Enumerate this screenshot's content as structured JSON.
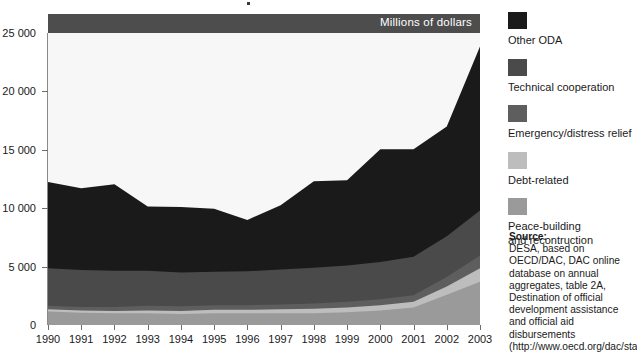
{
  "banner": {
    "label": "Millions of dollars"
  },
  "legend": {
    "items": [
      {
        "label": "Other ODA",
        "color": "#1a1a1a",
        "key": "other_oda"
      },
      {
        "label": "Technical cooperation",
        "color": "#4a4a4a",
        "key": "technical_cooperation"
      },
      {
        "label": "Emergency/distress relief",
        "color": "#5e5e5e",
        "key": "emergency_distress_relief"
      },
      {
        "label": "Debt-related",
        "color": "#bdbdbd",
        "key": "debt_related"
      },
      {
        "label": "Peace-building\nand recontruction",
        "color": "#9a9a9a",
        "key": "peace_building"
      }
    ]
  },
  "source": {
    "title": "Source:",
    "text": "DESA, based on OECD/DAC, DAC online database on annual aggregates, table 2A, Destination of official development assistance and official aid disbursements (http://www.oecd.org/dac/stats/idsonline)."
  },
  "chart_data": {
    "type": "area",
    "title": "Millions of dollars",
    "xlabel": "",
    "ylabel": "Millions of dollars",
    "ylim": [
      0,
      25000
    ],
    "ytick_values": [
      0,
      5000,
      10000,
      15000,
      20000,
      25000
    ],
    "ytick_labels": [
      "0",
      "5 000",
      "10 000",
      "15 000",
      "20 000",
      "25 000"
    ],
    "grid": false,
    "legend_position": "right",
    "stacked": true,
    "stack_order_bottom_to_top": [
      "Peace-building and recontruction",
      "Debt-related",
      "Emergency/distress relief",
      "Technical cooperation",
      "Other ODA"
    ],
    "categories": [
      1990,
      1991,
      1992,
      1993,
      1994,
      1995,
      1996,
      1997,
      1998,
      1999,
      2000,
      2001,
      2002,
      2003
    ],
    "x": [
      "1990",
      "1991",
      "1992",
      "1993",
      "1994",
      "1995",
      "1996",
      "1997",
      "1998",
      "1999",
      "2000",
      "2001",
      "2002",
      "2003"
    ],
    "series": [
      {
        "name": "Peace-building and recontruction",
        "color": "#9a9a9a",
        "values": [
          1150,
          1050,
          1000,
          1000,
          950,
          1000,
          1000,
          1000,
          1000,
          1100,
          1250,
          1500,
          2600,
          3700
        ]
      },
      {
        "name": "Debt-related",
        "color": "#bdbdbd",
        "values": [
          200,
          200,
          200,
          250,
          250,
          300,
          300,
          350,
          400,
          400,
          450,
          500,
          700,
          1150
        ]
      },
      {
        "name": "Emergency/distress relief",
        "color": "#5e5e5e",
        "values": [
          300,
          300,
          350,
          400,
          400,
          400,
          400,
          400,
          450,
          500,
          500,
          550,
          800,
          1100
        ]
      },
      {
        "name": "Technical cooperation",
        "color": "#4a4a4a",
        "values": [
          3200,
          3150,
          3100,
          3000,
          2900,
          2850,
          2900,
          3000,
          3050,
          3100,
          3200,
          3300,
          3500,
          3850
        ]
      },
      {
        "name": "Other ODA",
        "color": "#1a1a1a",
        "values": [
          7400,
          7000,
          7400,
          5500,
          5600,
          5400,
          4400,
          5500,
          7400,
          7300,
          9650,
          9200,
          9400,
          14050
        ]
      }
    ],
    "totals": [
      12250,
      11700,
      12050,
      10150,
      10100,
      9950,
      9000,
      10250,
      12300,
      12400,
      15050,
      15050,
      17000,
      23850
    ]
  }
}
